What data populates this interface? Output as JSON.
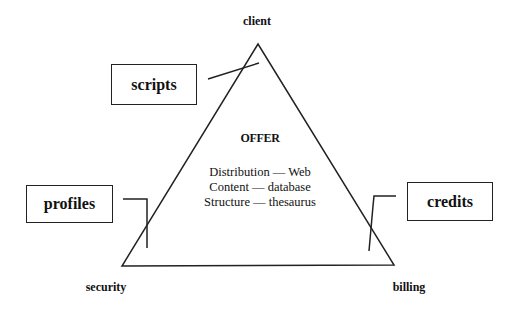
{
  "diagram": {
    "vertices": {
      "top": {
        "label": "client",
        "x": 258,
        "y": 44
      },
      "bottom_left": {
        "label": "security",
        "x": 122,
        "y": 266
      },
      "bottom_right": {
        "label": "billing",
        "x": 394,
        "y": 265
      }
    },
    "boxes": [
      {
        "label": "scripts",
        "connects_to": "client-security edge"
      },
      {
        "label": "profiles",
        "connects_to": "client-security edge"
      },
      {
        "label": "credits",
        "connects_to": "client-billing edge"
      }
    ],
    "center": {
      "title": "OFFER",
      "lines": [
        "Distribution — Web",
        "Content — database",
        "Structure — thesaurus"
      ]
    }
  },
  "colors": {
    "stroke": "#222222",
    "background": "#ffffff",
    "text": "#111111"
  }
}
